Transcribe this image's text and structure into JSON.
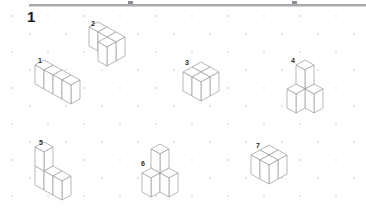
{
  "page": {
    "background_color": "#ffffff",
    "rule_color": "#a9a9ad",
    "line_color": "#9a9aa0",
    "dot_color": "#d9d9de",
    "label_color": "#2a2a2a",
    "width": 366,
    "height": 211
  },
  "header": {
    "exercise_number": "1",
    "rule_visible": true
  },
  "grid": {
    "type": "isometric-dot-lattice",
    "dot_spacing_x": 36,
    "dot_spacing_y": 18,
    "dot_radius": 0.9,
    "columns": 11,
    "rows": 12
  },
  "figures": [
    {
      "label": "1",
      "name": "figure-1",
      "description": "Row of four unit cubes in a straight line receding to the lower-right",
      "cube_count": 4,
      "cubes": [
        [
          0,
          0,
          0
        ],
        [
          1,
          0,
          0
        ],
        [
          2,
          0,
          0
        ],
        [
          3,
          0,
          0
        ]
      ],
      "left": 33,
      "top": 58,
      "label_left": 5,
      "label_top": -1
    },
    {
      "label": "2",
      "name": "figure-2",
      "description": "Three cubes in a row with one cube set back behind the left end, forming an L",
      "cube_count": 4,
      "cubes": [
        [
          0,
          0,
          0
        ],
        [
          1,
          0,
          0
        ],
        [
          2,
          0,
          0
        ],
        [
          2,
          1,
          0
        ]
      ],
      "left": 87,
      "top": 20,
      "label_left": 4,
      "label_top": 0
    },
    {
      "label": "3",
      "name": "figure-3",
      "description": "Two by two flat slab of four cubes one layer high",
      "cube_count": 4,
      "cubes": [
        [
          0,
          0,
          0
        ],
        [
          1,
          0,
          0
        ],
        [
          0,
          1,
          0
        ],
        [
          1,
          1,
          0
        ]
      ],
      "left": 181,
      "top": 60,
      "label_left": 4,
      "label_top": -1
    },
    {
      "label": "4",
      "name": "figure-4",
      "description": "Stepped stack: two cubes stacked vertically on the left with a single cube beside them at the lower level",
      "cube_count": 4,
      "cubes": [
        [
          0,
          0,
          0
        ],
        [
          0,
          0,
          1
        ],
        [
          1,
          0,
          0
        ],
        [
          0,
          1,
          0
        ]
      ],
      "left": 285,
      "top": 58,
      "label_left": 6,
      "label_top": -1
    },
    {
      "label": "5",
      "name": "figure-5",
      "description": "Stepped shape: a cube on top of a cube at the back-left with two cubes extending to the right at the lower level",
      "cube_count": 4,
      "cubes": [
        [
          0,
          0,
          0
        ],
        [
          0,
          0,
          1
        ],
        [
          1,
          0,
          0
        ],
        [
          2,
          0,
          0
        ]
      ],
      "left": 33,
      "top": 140,
      "label_left": 6,
      "label_top": -1
    },
    {
      "label": "6",
      "name": "figure-6",
      "description": "Tripod cluster: one cube raised on top between two cubes set to the left and right below",
      "cube_count": 3,
      "cubes": [
        [
          0,
          0,
          1
        ],
        [
          0,
          1,
          0
        ],
        [
          1,
          0,
          0
        ]
      ],
      "left": 140,
      "top": 142,
      "label_left": 1,
      "label_top": 18
    },
    {
      "label": "7",
      "name": "figure-7",
      "description": "Two by two flat slab of four cubes one layer high",
      "cube_count": 4,
      "cubes": [
        [
          0,
          0,
          0
        ],
        [
          1,
          0,
          0
        ],
        [
          0,
          1,
          0
        ],
        [
          1,
          1,
          0
        ]
      ],
      "left": 249,
      "top": 143,
      "label_left": 7,
      "label_top": -1
    }
  ]
}
